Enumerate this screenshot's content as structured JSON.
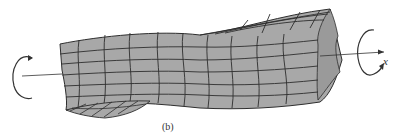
{
  "figure": {
    "caption": "(b)",
    "axis_label": "x",
    "colors": {
      "body_fill": "#a8a8a8",
      "end_face_fill": "#9a9a9a",
      "grid_line": "#2e2e2e",
      "arrow": "#333333",
      "background": "#ffffff"
    }
  }
}
